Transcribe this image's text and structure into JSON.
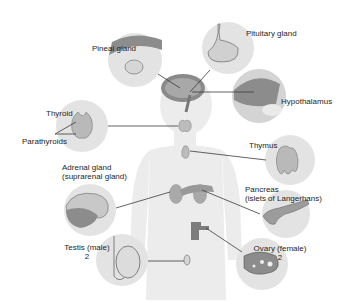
{
  "diagram": {
    "colors": {
      "background": "#ffffff",
      "body_silhouette": "#ececec",
      "inset_circle": "#e3e3e3",
      "gland_fill": "#b9b9b9",
      "gland_dark": "#8c8c8c",
      "leader_line": "#3a3a3a",
      "text": "#1e1e1e"
    },
    "labels": {
      "pineal": "Pineal gland",
      "pituitary": "Pituitary gland",
      "hypothalamus": "Hypothalamus",
      "thyroid": "Thyroid",
      "parathyroids": "Parathyroids",
      "thymus": "Thymus",
      "adrenal_line1": "Adrenal gland",
      "adrenal_line2": "(suprarenal gland)",
      "pancreas_line1": "Pancreas",
      "pancreas_line2": "(islets of Langerhans)",
      "testis_line1": "Testis (male)",
      "testis_line2": "2",
      "ovary_line1": "Ovary (female)",
      "ovary_line2": "2"
    }
  }
}
